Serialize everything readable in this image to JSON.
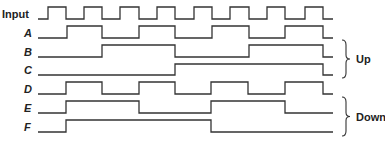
{
  "signals": [
    {
      "label": "Input",
      "italic": false,
      "y_low": 19,
      "y_high": 7,
      "edges": [
        38,
        48,
        66,
        84,
        102,
        120,
        139,
        157,
        175,
        194,
        212,
        230,
        249,
        267,
        285,
        305,
        323,
        333
      ]
    },
    {
      "label": "A",
      "italic": true,
      "y_low": 38,
      "y_high": 26,
      "edges": [
        38,
        67,
        102,
        139,
        175,
        212,
        249,
        285,
        323,
        333
      ]
    },
    {
      "label": "B",
      "italic": true,
      "y_low": 57,
      "y_high": 45,
      "edges": [
        38,
        102,
        175,
        249,
        323,
        333
      ]
    },
    {
      "label": "C",
      "italic": true,
      "y_low": 75,
      "y_high": 64,
      "edges": [
        38,
        175,
        323,
        333
      ]
    },
    {
      "label": "D",
      "italic": true,
      "y_low": 94,
      "y_high": 82,
      "edges": [
        38,
        66,
        102,
        139,
        175,
        211,
        248,
        285,
        323,
        333
      ]
    },
    {
      "label": "E",
      "italic": true,
      "y_low": 113,
      "y_high": 101,
      "edges": [
        38,
        66,
        139,
        211,
        285,
        333
      ]
    },
    {
      "label": "F",
      "italic": true,
      "y_low": 132,
      "y_high": 120,
      "edges": [
        38,
        66,
        211,
        333
      ]
    }
  ],
  "groups": [
    {
      "label": "Up",
      "y_top": 40,
      "y_bottom": 78
    },
    {
      "label": "Down",
      "y_top": 97,
      "y_bottom": 136
    }
  ]
}
